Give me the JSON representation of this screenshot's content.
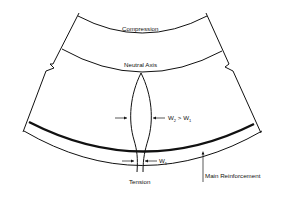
{
  "diagram": {
    "labels": {
      "compression": "Compression",
      "neutral_axis": "Neutral Axis",
      "tension": "Tension",
      "main_reinforcement": "Main Reinforcement",
      "w2_main": "W",
      "w2_sub": "2",
      "w2_gt": " > W",
      "w2_gt_sub": "1",
      "w1_main": "W",
      "w1_sub": "1"
    },
    "colors": {
      "line": "#111111",
      "background": "#ffffff"
    }
  }
}
